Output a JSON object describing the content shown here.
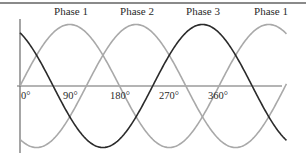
{
  "chart_data": {
    "type": "line",
    "title": "",
    "xlabel": "",
    "ylabel": "",
    "x_unit": "degrees",
    "x_range": [
      0,
      480
    ],
    "y_range": [
      -1,
      1
    ],
    "grid": false,
    "legend_position": "inline-top",
    "tick_labels": [
      "0°",
      "90°",
      "180°",
      "270°",
      "360°"
    ],
    "tick_values": [
      0,
      90,
      180,
      270,
      360
    ],
    "series": [
      {
        "name": "Phase 1",
        "phase_offset_deg": 0,
        "formula": "sin(θ)",
        "color": "#a9a9a9",
        "peak_deg": 90
      },
      {
        "name": "Phase 2",
        "phase_offset_deg": -120,
        "formula": "sin(θ − 120°)",
        "color": "#a9a9a9",
        "peak_deg": 210
      },
      {
        "name": "Phase 3",
        "phase_offset_deg": 120,
        "formula": "sin(θ + 120°)",
        "color": "#2b2b2b",
        "peak_deg": 330
      }
    ],
    "annotations": [
      {
        "text": "Phase 1",
        "at_deg": 90
      },
      {
        "text": "Phase 2",
        "at_deg": 210
      },
      {
        "text": "Phase 3",
        "at_deg": 330
      },
      {
        "text": "Phase 1",
        "at_deg": 450
      }
    ]
  },
  "labels": {
    "peak1": "Phase 1",
    "peak2": "Phase 2",
    "peak3": "Phase 3",
    "peak4": "Phase 1",
    "tick0": "0°",
    "tick90": "90°",
    "tick180": "180°",
    "tick270": "270°",
    "tick360": "360°"
  }
}
